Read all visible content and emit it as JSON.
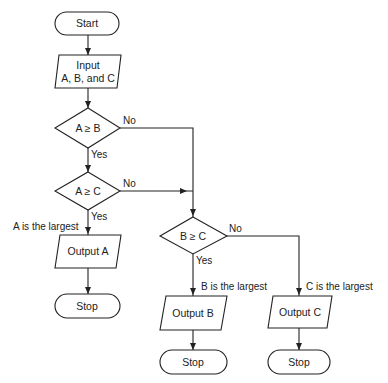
{
  "diagram": {
    "type": "flowchart",
    "nodes": {
      "start": {
        "label": "Start"
      },
      "input": {
        "line1": "Input",
        "line2": "A, B, and C"
      },
      "dec_ab": {
        "label": "A ≥ B"
      },
      "dec_ac": {
        "label": "A ≥ C"
      },
      "dec_bc": {
        "label": "B ≥ C"
      },
      "out_a": {
        "label": "Output A"
      },
      "out_b": {
        "label": "Output B"
      },
      "out_c": {
        "label": "Output C"
      },
      "stop_a": {
        "label": "Stop"
      },
      "stop_b": {
        "label": "Stop"
      },
      "stop_c": {
        "label": "Stop"
      }
    },
    "edge_labels": {
      "ab_no": "No",
      "ab_yes": "Yes",
      "ac_no": "No",
      "ac_yes": "Yes",
      "bc_no": "No",
      "bc_yes": "Yes",
      "a_largest": "A is the largest",
      "b_largest": "B is the largest",
      "c_largest": "C is the largest"
    }
  }
}
